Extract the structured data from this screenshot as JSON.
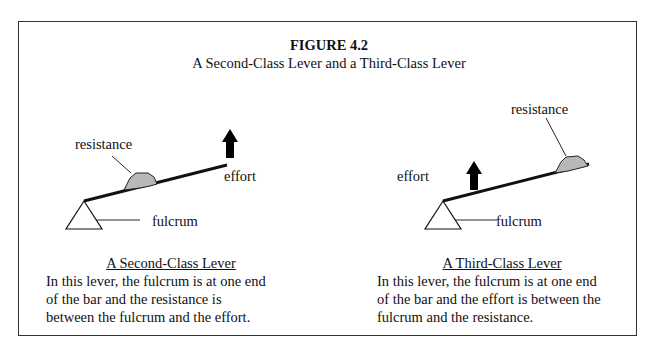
{
  "figure": {
    "title": "FIGURE 4.2",
    "subtitle": "A Second-Class Lever and a Third-Class Lever"
  },
  "diagrams": [
    {
      "id": "second-class",
      "labels": {
        "resistance": "resistance",
        "effort": "effort",
        "fulcrum": "fulcrum"
      },
      "caption": "A Second-Class Lever",
      "description_lines": [
        "In this lever, the fulcrum is at one end",
        "of the bar and the resistance is",
        "between the fulcrum and the effort."
      ]
    },
    {
      "id": "third-class",
      "labels": {
        "resistance": "resistance",
        "effort": "effort",
        "fulcrum": "fulcrum"
      },
      "caption": "A Third-Class Lever",
      "description_lines": [
        "In this lever, the fulcrum is at one end",
        "of the bar and the effort is between the",
        "fulcrum and the resistance."
      ]
    }
  ],
  "colors": {
    "border": "#333333",
    "resistance_fill": "#b8b8b8",
    "ink": "#111111"
  }
}
